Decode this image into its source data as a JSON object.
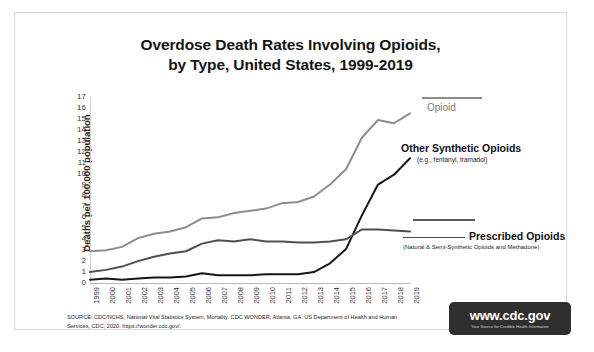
{
  "title": {
    "line1": "Overdose Death Rates Involving Opioids,",
    "line2": "by Type, United States, 1999-2019"
  },
  "annotations": {
    "opioid": "Opioid",
    "other_synthetic": "Other Synthetic Opioids",
    "other_synthetic_sub": "(e.g., fentanyl, tramadol)",
    "prescribed": "Prescribed Opioids",
    "prescribed_sub": "(Natural & Semi-Synthetic Opioids and Methadone)"
  },
  "source": "SOURCE: CDC/NCHS, National Vital Statistics System, Mortality. CDC WONDER, Atlanta, GA: US Department of Health and Human Services, CDC; 2020. https://wonder.cdc.gov/.",
  "logo": {
    "main": "www.cdc.gov",
    "tagline": "Your Source for Credible Health Information"
  },
  "colors": {
    "opioid": "#8d8d8d",
    "other_synthetic": "#171717",
    "prescribed": "#4f4f4f",
    "axis": "#c4c4c4",
    "logo_bg": "#2f2f2f"
  },
  "chart_data": {
    "type": "line",
    "title": "Overdose Death Rates Involving Opioids, by Type, United States, 1999-2019",
    "xlabel": "",
    "ylabel": "Deaths per 100,000 population",
    "ylim": [
      0,
      17
    ],
    "ytick_labels": [
      "0",
      "1",
      "2",
      "3",
      "4",
      "5",
      "6",
      "7",
      "8",
      "9",
      "10",
      "11",
      "12",
      "13",
      "14",
      "15",
      "16",
      "17"
    ],
    "grid": false,
    "legend_position": "right-inline-annotations",
    "x": [
      1999,
      2000,
      2001,
      2002,
      2003,
      2004,
      2005,
      2006,
      2007,
      2008,
      2009,
      2010,
      2011,
      2012,
      2013,
      2014,
      2015,
      2016,
      2017,
      2018,
      2019
    ],
    "series": [
      {
        "name": "Opioid",
        "color": "#8d8d8d",
        "values": [
          2.9,
          3.0,
          3.3,
          4.1,
          4.5,
          4.7,
          5.1,
          5.9,
          6.0,
          6.4,
          6.6,
          6.8,
          7.3,
          7.4,
          7.9,
          9.0,
          10.4,
          13.3,
          14.9,
          14.6,
          15.5
        ]
      },
      {
        "name": "Other Synthetic Opioids",
        "color": "#171717",
        "values": [
          0.3,
          0.4,
          0.3,
          0.4,
          0.5,
          0.5,
          0.6,
          0.9,
          0.7,
          0.7,
          0.7,
          0.8,
          0.8,
          0.8,
          1.0,
          1.8,
          3.1,
          6.2,
          9.0,
          9.9,
          11.4
        ]
      },
      {
        "name": "Prescribed Opioids",
        "color": "#4f4f4f",
        "values": [
          1.0,
          1.2,
          1.5,
          2.0,
          2.4,
          2.7,
          2.9,
          3.6,
          3.9,
          3.8,
          4.0,
          3.8,
          3.8,
          3.7,
          3.7,
          3.8,
          4.0,
          4.9,
          4.9,
          4.8,
          4.7
        ]
      }
    ]
  }
}
